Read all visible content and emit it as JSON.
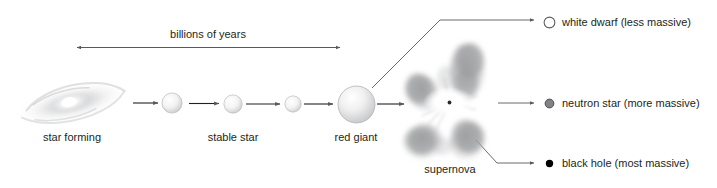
{
  "diagram": {
    "timeline": {
      "label": "billions of years",
      "arrow": "double-headed-arrow"
    },
    "stages": [
      {
        "id": "star-forming",
        "label": "star forming",
        "icon": "nebula-icon",
        "cx": 72,
        "cy": 103
      },
      {
        "id": "protostar-1",
        "label": "",
        "icon": "star-sphere-icon",
        "cx": 172,
        "cy": 103,
        "d": 21
      },
      {
        "id": "stable-star",
        "label": "stable star",
        "icon": "star-sphere-icon",
        "cx": 233,
        "cy": 104,
        "d": 19
      },
      {
        "id": "aging-star",
        "label": "",
        "icon": "star-sphere-icon",
        "cx": 293,
        "cy": 104,
        "d": 17
      },
      {
        "id": "red-giant",
        "label": "red giant",
        "icon": "star-sphere-icon",
        "cx": 356,
        "cy": 104,
        "d": 37
      }
    ],
    "supernova": {
      "label": "supernova",
      "icon": "supernova-cloud-icon",
      "cx": 450,
      "cy": 100
    },
    "outcomes": [
      {
        "id": "white-dwarf",
        "label": "white dwarf (less massive)",
        "icon": "white-dwarf-icon",
        "marker_fill": "#ffffff",
        "marker_stroke": "#58595b",
        "marker_d": 11,
        "y": 22
      },
      {
        "id": "neutron-star",
        "label": "neutron star (more massive)",
        "icon": "neutron-star-icon",
        "marker_fill": "#808285",
        "marker_stroke": "#404040",
        "marker_d": 9,
        "y": 103
      },
      {
        "id": "black-hole",
        "label": "black hole (most massive)",
        "icon": "black-hole-icon",
        "marker_fill": "#000000",
        "marker_stroke": "#000000",
        "marker_d": 7,
        "y": 163
      }
    ],
    "colors": {
      "line": "#58595b",
      "text": "#231f20",
      "background": "#ffffff",
      "sphere_light": "#ffffff",
      "sphere_shade": "#c9cacc",
      "cloud": "#9a9b9d"
    }
  }
}
